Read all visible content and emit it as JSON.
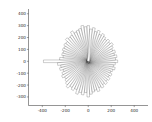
{
  "figure": {
    "background_color": "#ffffff",
    "width": 152,
    "height": 122
  },
  "chart_data": {
    "type": "bar",
    "subtype": "radial-rose-bar",
    "title": "",
    "subtitle": "",
    "xlabel": "",
    "ylabel": "",
    "xlim": [
      -520,
      520
    ],
    "ylim": [
      -372,
      440
    ],
    "grid": false,
    "legend": null,
    "legend_position": "none",
    "annotations": [],
    "bar_style": {
      "fill_color": "#ffffff",
      "edge_color": "#1a1a1a",
      "edge_width": 0.22,
      "fill_opacity": 0.55
    },
    "axis": {
      "x_ticks": [
        -400,
        -200,
        0,
        200,
        400
      ],
      "x_tick_labels": [
        "-400",
        "-200",
        "0",
        "200",
        "400"
      ],
      "y_ticks": [
        -300,
        -200,
        -100,
        0,
        100,
        200,
        300,
        400
      ],
      "y_tick_labels": [
        "-300",
        "-200",
        "-100",
        "0",
        "100",
        "200",
        "300",
        "400"
      ],
      "spines_visible": [
        "left",
        "bottom"
      ],
      "tick_color": "#2b2b2b",
      "tick_label_size": 4.1
    },
    "center": [
      0,
      0
    ],
    "n_bars": 72,
    "angle_step_deg": 5,
    "bar_half_width": 11,
    "angles_deg": [
      0,
      5,
      10,
      15,
      20,
      25,
      30,
      35,
      40,
      45,
      50,
      55,
      60,
      65,
      70,
      75,
      80,
      85,
      90,
      95,
      100,
      105,
      110,
      115,
      120,
      125,
      130,
      135,
      140,
      145,
      150,
      155,
      160,
      165,
      170,
      175,
      180,
      185,
      190,
      195,
      200,
      205,
      210,
      215,
      220,
      225,
      230,
      235,
      240,
      245,
      250,
      255,
      260,
      265,
      270,
      275,
      280,
      285,
      290,
      295,
      300,
      305,
      310,
      315,
      320,
      325,
      330,
      335,
      340,
      345,
      350,
      355
    ],
    "radii": [
      300,
      292,
      305,
      284,
      276,
      268,
      290,
      262,
      258,
      270,
      246,
      252,
      238,
      244,
      230,
      236,
      222,
      250,
      390,
      268,
      242,
      256,
      230,
      248,
      262,
      244,
      256,
      270,
      286,
      262,
      278,
      258,
      292,
      272,
      286,
      264,
      300,
      278,
      262,
      250,
      268,
      240,
      254,
      232,
      246,
      226,
      238,
      218,
      232,
      214,
      226,
      240,
      222,
      236,
      256,
      238,
      252,
      234,
      248,
      230,
      244,
      258,
      240,
      254,
      236,
      250,
      264,
      246,
      274,
      258,
      286,
      272
    ]
  }
}
